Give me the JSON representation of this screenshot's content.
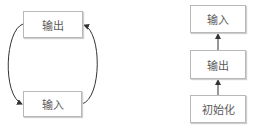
{
  "left_diagram": {
    "nodes": [
      {
        "id": "output",
        "label": "输出"
      },
      {
        "id": "input",
        "label": "输入"
      }
    ],
    "edges": [
      {
        "from": "output",
        "to": "input",
        "side": "left"
      },
      {
        "from": "input",
        "to": "output",
        "side": "right"
      }
    ]
  },
  "right_diagram": {
    "nodes": [
      {
        "id": "input",
        "label": "输入"
      },
      {
        "id": "output",
        "label": "输出"
      },
      {
        "id": "init",
        "label": "初始化"
      }
    ],
    "edges": [
      {
        "from": "init",
        "to": "output"
      },
      {
        "from": "output",
        "to": "input"
      }
    ]
  },
  "colors": {
    "border": "#b8b8b8",
    "arrow": "#333333",
    "text": "#5a5a5a"
  }
}
